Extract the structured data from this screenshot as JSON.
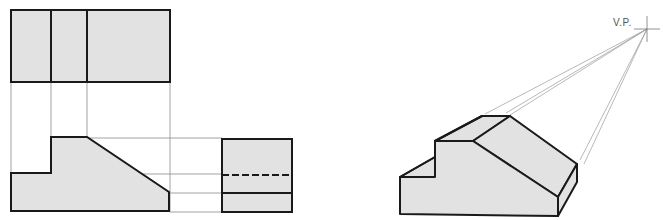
{
  "diagram": {
    "vanishing_point_label": "V.P.",
    "colors": {
      "fill": "#e2e2e2",
      "outline": "#1a1a1a",
      "construction": "#8a8a8a"
    },
    "views": [
      "top-view",
      "front-view",
      "side-view",
      "perspective-view"
    ]
  }
}
